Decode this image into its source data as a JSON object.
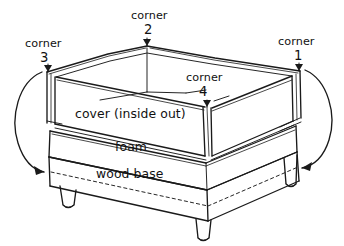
{
  "figure": {
    "kind": "hand-drawn-line-diagram",
    "ink_color": "#1a1a1a",
    "background_color": "#ffffff"
  },
  "corners": [
    {
      "id": "corner-1",
      "word": "corner",
      "number": "1",
      "position": "right"
    },
    {
      "id": "corner-2",
      "word": "corner",
      "number": "2",
      "position": "top-center"
    },
    {
      "id": "corner-3",
      "word": "corner",
      "number": "3",
      "position": "left"
    },
    {
      "id": "corner-4",
      "word": "corner",
      "number": "4",
      "position": "front-center"
    }
  ],
  "layers": {
    "cover": "cover (inside out)",
    "foam": "foam",
    "wood_base": "wood base"
  }
}
